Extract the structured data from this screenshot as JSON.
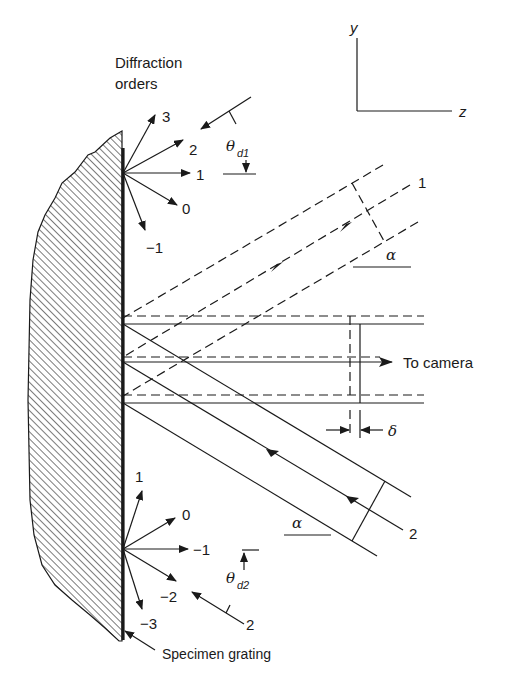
{
  "figure": {
    "title_label": "Diffraction orders",
    "title_line1": "Diffraction",
    "title_line2": "orders",
    "axes": {
      "y_label": "y",
      "z_label": "z"
    },
    "top_orders": [
      "3",
      "2",
      "1",
      "0",
      "−1"
    ],
    "bottom_orders": [
      "1",
      "0",
      "−1",
      "−2",
      "−3"
    ],
    "angle_top": {
      "symbol": "θ",
      "subscript": "d1"
    },
    "angle_bottom": {
      "symbol": "θ",
      "subscript": "d2"
    },
    "beam_1_label": "1",
    "beam_2_label": "2",
    "incident_top_label": "",
    "incident_bottom_label": "2",
    "alpha_top": "α",
    "alpha_bottom": "α",
    "delta": "δ",
    "camera_label": "To camera",
    "grating_label": "Specimen grating"
  },
  "colors": {
    "ink": "#1a1a1a",
    "background": "#ffffff"
  }
}
